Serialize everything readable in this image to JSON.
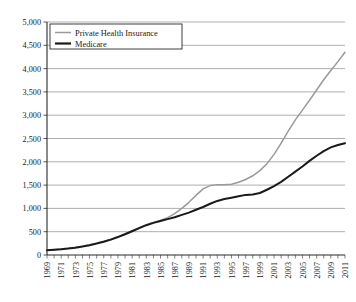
{
  "chart_data": {
    "type": "line",
    "title": "",
    "xlabel": "",
    "ylabel": "",
    "ylim": [
      0,
      5000
    ],
    "ytick_values": [
      0,
      500,
      1000,
      1500,
      2000,
      2500,
      3000,
      3500,
      4000,
      4500,
      5000
    ],
    "ytick_labels": [
      "0",
      "500",
      "1,000",
      "1,500",
      "2,000",
      "2,500",
      "3,000",
      "3,500",
      "4,000",
      "4,500",
      "5,000"
    ],
    "grid": true,
    "legend_position": "top-left-inside",
    "x": [
      1969,
      1970,
      1971,
      1972,
      1973,
      1974,
      1975,
      1976,
      1977,
      1978,
      1979,
      1980,
      1981,
      1982,
      1983,
      1984,
      1985,
      1986,
      1987,
      1988,
      1989,
      1990,
      1991,
      1992,
      1993,
      1994,
      1995,
      1996,
      1997,
      1998,
      1999,
      2000,
      2001,
      2002,
      2003,
      2004,
      2005,
      2006,
      2007,
      2008,
      2009,
      2010,
      2011
    ],
    "xtick_labels": [
      "1969",
      "1971",
      "1973",
      "1975",
      "1977",
      "1979",
      "1981",
      "1983",
      "1985",
      "1987",
      "1989",
      "1991",
      "1993",
      "1995",
      "1997",
      "1999",
      "2001",
      "2003",
      "2005",
      "2007",
      "2009",
      "2011"
    ],
    "series": [
      {
        "name": "Private Health Insurance",
        "color": "#9a9a9a",
        "values": [
          105,
          115,
          130,
          145,
          165,
          190,
          220,
          255,
          295,
          340,
          395,
          455,
          520,
          585,
          650,
          700,
          745,
          800,
          890,
          1000,
          1130,
          1280,
          1420,
          1490,
          1510,
          1510,
          1520,
          1560,
          1620,
          1700,
          1810,
          1960,
          2160,
          2400,
          2660,
          2900,
          3110,
          3320,
          3540,
          3760,
          3960,
          4150,
          4350
        ]
      },
      {
        "name": "Medicare",
        "color": "#1a1a1a",
        "values": [
          100,
          110,
          122,
          138,
          158,
          182,
          210,
          245,
          285,
          330,
          385,
          445,
          510,
          575,
          640,
          690,
          730,
          770,
          810,
          860,
          910,
          970,
          1030,
          1100,
          1160,
          1200,
          1230,
          1260,
          1290,
          1300,
          1330,
          1400,
          1480,
          1570,
          1680,
          1790,
          1900,
          2020,
          2130,
          2230,
          2310,
          2360,
          2400
        ]
      }
    ]
  },
  "legend": {
    "items": [
      {
        "label": "Private Health Insurance",
        "color": "#9a9a9a"
      },
      {
        "label": "Medicare",
        "color": "#1a1a1a"
      }
    ]
  },
  "caption": {
    "text": ""
  }
}
